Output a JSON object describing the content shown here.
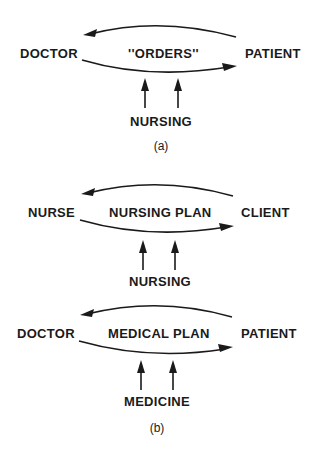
{
  "diagrams": {
    "a": {
      "left_node": "DOCTOR",
      "center_label": "''ORDERS''",
      "right_node": "PATIENT",
      "input_label": "NURSING",
      "caption": "(a)"
    },
    "b_nursing": {
      "left_node": "NURSE",
      "center_label": "NURSING PLAN",
      "right_node": "CLIENT",
      "input_label": "NURSING"
    },
    "b_medical": {
      "left_node": "DOCTOR",
      "center_label": "MEDICAL PLAN",
      "right_node": "PATIENT",
      "input_label": "MEDICINE",
      "caption": "(b)"
    }
  },
  "edges": [
    {
      "diagram": "a",
      "from": "PATIENT",
      "to": "DOCTOR",
      "direction": "left"
    },
    {
      "diagram": "a",
      "from": "DOCTOR",
      "to": "PATIENT",
      "direction": "right"
    },
    {
      "diagram": "b_nursing",
      "from": "CLIENT",
      "to": "NURSE",
      "direction": "left"
    },
    {
      "diagram": "b_nursing",
      "from": "NURSE",
      "to": "CLIENT",
      "direction": "right"
    },
    {
      "diagram": "b_medical",
      "from": "PATIENT",
      "to": "DOCTOR",
      "direction": "left"
    },
    {
      "diagram": "b_medical",
      "from": "DOCTOR",
      "to": "PATIENT",
      "direction": "right"
    }
  ]
}
